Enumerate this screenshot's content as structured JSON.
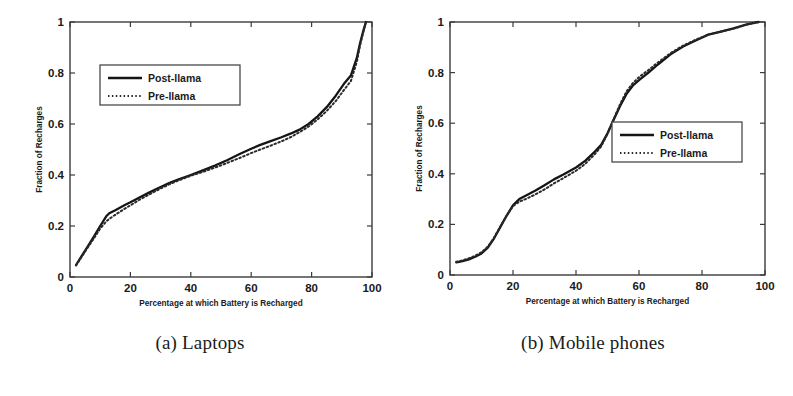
{
  "figure": {
    "background": "#ffffff",
    "ink_color": "#151515"
  },
  "panels": [
    {
      "id": "a",
      "caption": "(a) Laptops",
      "chart_data": {
        "type": "line",
        "title": "",
        "xlabel": "Percentage at which Battery is Recharged",
        "ylabel": "Fraction of Recharges",
        "xlim": [
          0,
          100
        ],
        "ylim": [
          0,
          1
        ],
        "xticks": [
          0,
          20,
          40,
          60,
          80,
          100
        ],
        "yticks": [
          0,
          0.2,
          0.4,
          0.6,
          0.8,
          1
        ],
        "xtick_labels": [
          "0",
          "20",
          "40",
          "60",
          "80",
          "100"
        ],
        "ytick_labels": [
          "0",
          "0.2",
          "0.4",
          "0.6",
          "0.8",
          "1"
        ],
        "grid": false,
        "legend_position": "upper-left",
        "series": [
          {
            "name": "Post-llama",
            "style": "solid",
            "color": "#151515",
            "x": [
              2,
              4,
              6,
              8,
              10,
              12,
              13,
              15,
              18,
              20,
              23,
              26,
              30,
              33,
              36,
              40,
              44,
              48,
              52,
              56,
              60,
              63,
              66,
              70,
              73,
              76,
              79,
              82,
              85,
              88,
              91,
              93,
              95,
              96,
              97,
              98
            ],
            "y": [
              0.047,
              0.085,
              0.122,
              0.16,
              0.2,
              0.238,
              0.25,
              0.262,
              0.281,
              0.293,
              0.312,
              0.33,
              0.353,
              0.369,
              0.383,
              0.4,
              0.418,
              0.437,
              0.458,
              0.481,
              0.503,
              0.518,
              0.531,
              0.548,
              0.562,
              0.578,
              0.6,
              0.63,
              0.666,
              0.711,
              0.762,
              0.79,
              0.86,
              0.915,
              0.96,
              1.0
            ]
          },
          {
            "name": "Pre-llama",
            "style": "dotted",
            "color": "#2a2a2a",
            "x": [
              2,
              4,
              6,
              8,
              10,
              12,
              13,
              15,
              18,
              20,
              23,
              26,
              30,
              33,
              36,
              40,
              44,
              48,
              52,
              56,
              60,
              63,
              66,
              70,
              73,
              76,
              79,
              82,
              85,
              88,
              91,
              93,
              95,
              96,
              97,
              98
            ],
            "y": [
              0.045,
              0.082,
              0.118,
              0.153,
              0.19,
              0.218,
              0.228,
              0.244,
              0.267,
              0.281,
              0.303,
              0.322,
              0.347,
              0.364,
              0.379,
              0.397,
              0.412,
              0.429,
              0.447,
              0.466,
              0.486,
              0.5,
              0.513,
              0.532,
              0.548,
              0.568,
              0.59,
              0.618,
              0.651,
              0.69,
              0.738,
              0.768,
              0.845,
              0.905,
              0.955,
              1.0
            ]
          }
        ],
        "legend": [
          "Post-llama",
          "Pre-llama"
        ]
      }
    },
    {
      "id": "b",
      "caption": "(b) Mobile phones",
      "chart_data": {
        "type": "line",
        "title": "",
        "xlabel": "Percentage at which Battery is Recharged",
        "ylabel": "Fraction of Recharges",
        "xlim": [
          0,
          100
        ],
        "ylim": [
          0,
          1
        ],
        "xticks": [
          0,
          20,
          40,
          60,
          80,
          100
        ],
        "yticks": [
          0,
          0.2,
          0.4,
          0.6,
          0.8,
          1
        ],
        "xtick_labels": [
          "0",
          "20",
          "40",
          "60",
          "80",
          "100"
        ],
        "ytick_labels": [
          "0",
          "0.2",
          "0.4",
          "0.6",
          "0.8",
          "1"
        ],
        "grid": false,
        "legend_position": "center-right",
        "series": [
          {
            "name": "Post-llama",
            "style": "solid",
            "color": "#151515",
            "x": [
              2,
              4,
              6,
              8,
              10,
              12,
              14,
              16,
              18,
              20,
              22,
              24,
              27,
              30,
              33,
              36,
              40,
              43,
              46,
              48,
              50,
              52,
              54,
              56,
              58,
              60,
              63,
              66,
              70,
              74,
              78,
              82,
              86,
              90,
              94,
              97,
              98
            ],
            "y": [
              0.05,
              0.055,
              0.062,
              0.072,
              0.085,
              0.108,
              0.145,
              0.19,
              0.235,
              0.275,
              0.3,
              0.313,
              0.333,
              0.355,
              0.378,
              0.397,
              0.425,
              0.452,
              0.488,
              0.515,
              0.56,
              0.615,
              0.668,
              0.715,
              0.748,
              0.77,
              0.8,
              0.832,
              0.872,
              0.903,
              0.927,
              0.95,
              0.962,
              0.975,
              0.99,
              0.998,
              1.0
            ]
          },
          {
            "name": "Pre-llama",
            "style": "dotted",
            "color": "#2a2a2a",
            "x": [
              2,
              4,
              6,
              8,
              10,
              12,
              14,
              16,
              18,
              20,
              22,
              24,
              27,
              30,
              33,
              36,
              40,
              43,
              46,
              48,
              50,
              52,
              54,
              56,
              58,
              60,
              63,
              66,
              70,
              74,
              78,
              82,
              86,
              90,
              94,
              97,
              98
            ],
            "y": [
              0.052,
              0.058,
              0.066,
              0.076,
              0.09,
              0.112,
              0.148,
              0.192,
              0.235,
              0.272,
              0.29,
              0.3,
              0.318,
              0.338,
              0.362,
              0.383,
              0.412,
              0.44,
              0.478,
              0.508,
              0.558,
              0.618,
              0.675,
              0.725,
              0.758,
              0.782,
              0.81,
              0.84,
              0.877,
              0.907,
              0.93,
              0.95,
              0.962,
              0.974,
              0.989,
              0.998,
              1.0
            ]
          }
        ],
        "legend": [
          "Post-llama",
          "Pre-llama"
        ]
      }
    }
  ]
}
